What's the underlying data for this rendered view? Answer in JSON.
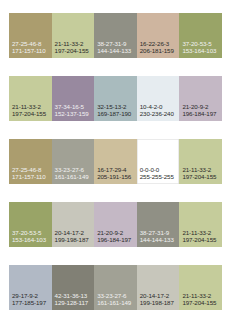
{
  "swatch_rows": [
    [
      {
        "cmyk": "27-25-46-8",
        "rgb": "171-157-110",
        "hex": "#ab9d6e",
        "text": "dark"
      },
      {
        "cmyk": "21-11-33-2",
        "rgb": "197-204-155",
        "hex": "#c5cc9b",
        "text": "light"
      },
      {
        "cmyk": "38-27-31-9",
        "rgb": "144-144-133",
        "hex": "#909085",
        "text": "dark"
      },
      {
        "cmyk": "16-22-26-3",
        "rgb": "206-181-159",
        "hex": "#ceb59f",
        "text": "light"
      },
      {
        "cmyk": "37-20-53-5",
        "rgb": "153-164-103",
        "hex": "#99a467",
        "text": "dark"
      }
    ],
    [
      {
        "cmyk": "21-11-33-2",
        "rgb": "197-204-155",
        "hex": "#c5cc9b",
        "text": "light"
      },
      {
        "cmyk": "37-34-16-5",
        "rgb": "152-137-159",
        "hex": "#98899f",
        "text": "dark"
      },
      {
        "cmyk": "32-15-13-2",
        "rgb": "169-187-190",
        "hex": "#a9bbbe",
        "text": "light"
      },
      {
        "cmyk": "10-4-2-0",
        "rgb": "230-236-240",
        "hex": "#e6ecf0",
        "text": "light"
      },
      {
        "cmyk": "21-20-9-2",
        "rgb": "196-184-197",
        "hex": "#c4b8c5",
        "text": "light"
      }
    ],
    [
      {
        "cmyk": "27-25-46-8",
        "rgb": "171-157-110",
        "hex": "#ab9d6e",
        "text": "dark"
      },
      {
        "cmyk": "33-23-27-6",
        "rgb": "161-161-149",
        "hex": "#a1a195",
        "text": "dark"
      },
      {
        "cmyk": "16-17-29-4",
        "rgb": "205-191-156",
        "hex": "#cdbf9c",
        "text": "light"
      },
      {
        "cmyk": "0-0-0-0",
        "rgb": "255-255-255",
        "hex": "#ffffff",
        "text": "light",
        "border": true
      },
      {
        "cmyk": "21-11-33-2",
        "rgb": "197-204-155",
        "hex": "#c5cc9b",
        "text": "light"
      }
    ],
    [
      {
        "cmyk": "37-20-53-5",
        "rgb": "153-164-103",
        "hex": "#99a467",
        "text": "dark"
      },
      {
        "cmyk": "20-14-17-2",
        "rgb": "199-198-187",
        "hex": "#c7c6bb",
        "text": "light"
      },
      {
        "cmyk": "21-20-9-2",
        "rgb": "196-184-197",
        "hex": "#c4b8c5",
        "text": "light"
      },
      {
        "cmyk": "38-27-31-9",
        "rgb": "144-144-133",
        "hex": "#909085",
        "text": "dark"
      },
      {
        "cmyk": "21-11-33-2",
        "rgb": "197-204-155",
        "hex": "#c5cc9b",
        "text": "light"
      }
    ],
    [
      {
        "cmyk": "29-17-9-2",
        "rgb": "177-185-197",
        "hex": "#b1b9c5",
        "text": "light"
      },
      {
        "cmyk": "42-31-36-13",
        "rgb": "129-128-117",
        "hex": "#818075",
        "text": "dark"
      },
      {
        "cmyk": "33-23-27-6",
        "rgb": "161-161-149",
        "hex": "#a1a195",
        "text": "dark"
      },
      {
        "cmyk": "20-14-17-2",
        "rgb": "199-198-187",
        "hex": "#c7c6bb",
        "text": "light"
      },
      {
        "cmyk": "21-11-33-2",
        "rgb": "197-204-155",
        "hex": "#c5cc9b",
        "text": "light"
      }
    ]
  ]
}
